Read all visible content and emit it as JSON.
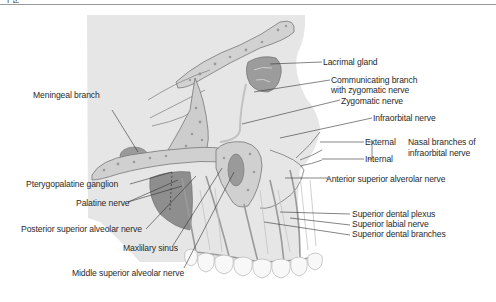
{
  "header": {
    "fragment": "구분"
  },
  "diagram": {
    "colors": {
      "skull_bg": "#e4e4e4",
      "bone": "#cfcfcf",
      "bone_spot": "#9a9a9a",
      "dark_tissue": "#8c8c8c",
      "nerve": "#bdbdbd",
      "outline": "#6e6e6e",
      "teeth": "#f7f7f7",
      "leader": "#333333"
    },
    "labels": {
      "lacrimal_gland": "Lacrimal gland",
      "communicating_branch_1": "Communicating branch",
      "communicating_branch_2": "with zygomatic nerve",
      "zygomatic_nerve": "Zygomatic nerve",
      "infraorbital_nerve": "Infraorbital nerve",
      "external": "External",
      "internal": "Internal",
      "nasal_branches_1": "Nasal branches of",
      "nasal_branches_2": "infraorbital nerve",
      "anterior_superior_alveolar_nerve": "Anterior superior alverolar nerve",
      "superior_dental_plexus": "Superior dental plexus",
      "superior_labial_nerve": "Superior labial nerve",
      "superior_dental_branches": "Superior dental branches",
      "meningeal_branch": "Meningeal branch",
      "pterygopalatine_ganglion": "Pterygopalatine ganglion",
      "palatine_nerve": "Palatine nerve",
      "posterior_superior_alveolar_nerve": "Posterior superior alveolar nerve",
      "maxillary_sinus": "Maxlilary sinus",
      "middle_superior_alveolar_nerve": "Middle superior alveolar nerve"
    }
  }
}
